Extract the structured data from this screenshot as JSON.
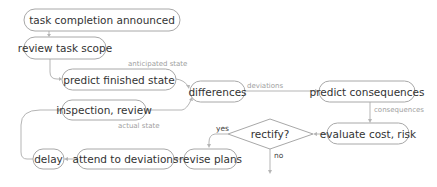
{
  "diagram": {
    "type": "flowchart",
    "colors": {
      "node_border": "#a8a8a8",
      "edge": "#b5b5b5",
      "text": "#333333",
      "edge_label": "#a0a0a0"
    },
    "nodes": {
      "task_completion": "task completion announced",
      "review_scope": "review task scope",
      "predict_finished": "predict finished state",
      "inspection": "inspection, review",
      "differences": "differences",
      "predict_consequences": "predict consequences",
      "evaluate": "evaluate cost, risk",
      "rectify": "rectify?",
      "revise_plans": "revise plans",
      "attend": "attend to deviations",
      "delay": "delay"
    },
    "edge_labels": {
      "anticipated_state": "anticipated state",
      "actual_state": "actual state",
      "deviations": "deviations",
      "consequences": "consequences",
      "yes": "yes",
      "no": "no"
    },
    "edges": [
      [
        "task completion announced",
        "review task scope"
      ],
      [
        "review task scope",
        "predict finished state"
      ],
      [
        "predict finished state",
        "differences",
        "anticipated state"
      ],
      [
        "inspection, review",
        "differences",
        "actual state"
      ],
      [
        "differences",
        "predict consequences",
        "deviations"
      ],
      [
        "predict consequences",
        "evaluate cost, risk",
        "consequences"
      ],
      [
        "evaluate cost, risk",
        "rectify?"
      ],
      [
        "rectify?",
        "revise plans",
        "yes"
      ],
      [
        "rectify?",
        "(exit)",
        "no"
      ],
      [
        "revise plans",
        "attend to deviations"
      ],
      [
        "attend to deviations",
        "delay"
      ],
      [
        "delay",
        "inspection, review"
      ]
    ]
  }
}
